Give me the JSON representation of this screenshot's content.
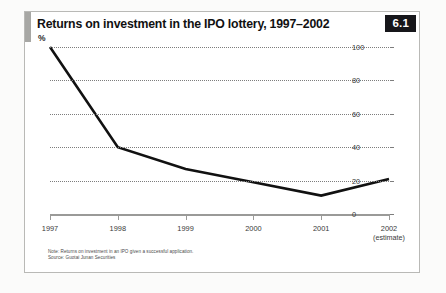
{
  "figure": {
    "badge": "6.1",
    "title": "Returns on investment in the IPO lottery, 1997–2002",
    "unit_label": "%",
    "note": "Note: Returns on investment in an IPO given a successful application.",
    "source": "Source: Guotai Junan Securities"
  },
  "chart_data": {
    "type": "line",
    "title": "Returns on investment in the IPO lottery, 1997–2002",
    "subtitle": "",
    "xlabel": "",
    "ylabel": "%",
    "categories": [
      "1997",
      "1998",
      "1999",
      "2000",
      "2001",
      "2002"
    ],
    "category_sublabels": [
      "",
      "",
      "",
      "",
      "",
      "(estimate)"
    ],
    "values": [
      100,
      40,
      27,
      19,
      11,
      21
    ],
    "series": [
      {
        "name": "Returns on investment",
        "values": [
          100,
          40,
          27,
          19,
          11,
          21
        ]
      }
    ],
    "ylim": [
      0,
      100
    ],
    "yticks": [
      0,
      20,
      40,
      60,
      80,
      100
    ],
    "ytick_labels": [
      "0",
      "20",
      "40",
      "60",
      "80",
      "100"
    ],
    "grid": true,
    "grid_style": "dotted",
    "legend": false,
    "axis_position": "right",
    "line_color": "#111111",
    "grid_color": "#7d7d7d",
    "axis_color": "#9a9a98"
  }
}
